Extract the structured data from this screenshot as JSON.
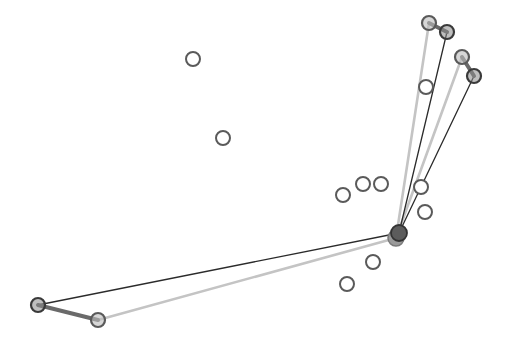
{
  "diagram": {
    "width": 526,
    "height": 348,
    "background": "#ffffff",
    "colors": {
      "dark_edge": "#2b2b2b",
      "light_edge": "#c4c4c4",
      "pair_edge": "#6a6a6a",
      "node_stroke": "#5a5a5a",
      "node_stroke_dark": "#3a3a3a",
      "node_fill_gray": "#8a8a8a",
      "hub_fill": "#5c5c5c"
    },
    "hub": {
      "x": 399,
      "y": 233,
      "r": 8
    },
    "hub_shadow": {
      "x": 396,
      "y": 238,
      "r": 8
    },
    "free_nodes": [
      {
        "id": "n1",
        "x": 193,
        "y": 59
      },
      {
        "id": "n2",
        "x": 223,
        "y": 138
      },
      {
        "id": "n3",
        "x": 343,
        "y": 195
      },
      {
        "id": "n4",
        "x": 363,
        "y": 184
      },
      {
        "id": "n5",
        "x": 381,
        "y": 184
      },
      {
        "id": "n6",
        "x": 426,
        "y": 87
      },
      {
        "id": "n7",
        "x": 421,
        "y": 187
      },
      {
        "id": "n8",
        "x": 425,
        "y": 212
      },
      {
        "id": "n9",
        "x": 373,
        "y": 262
      },
      {
        "id": "n10",
        "x": 347,
        "y": 284
      }
    ],
    "pairs": [
      {
        "id": "pair-top-left",
        "light": {
          "x": 429,
          "y": 23
        },
        "dark": {
          "x": 447,
          "y": 32
        }
      },
      {
        "id": "pair-top-right",
        "light": {
          "x": 462,
          "y": 57
        },
        "dark": {
          "x": 474,
          "y": 76
        }
      },
      {
        "id": "pair-bottom-left",
        "light": {
          "x": 98,
          "y": 320
        },
        "dark": {
          "x": 38,
          "y": 305
        }
      }
    ],
    "node_radius": 7
  }
}
